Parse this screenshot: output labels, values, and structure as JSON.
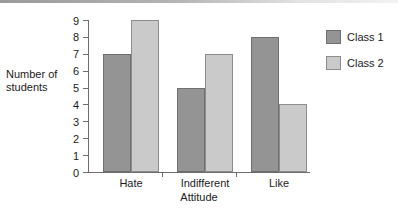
{
  "chart_data": {
    "type": "bar",
    "title": "",
    "xlabel": "Attitude",
    "ylabel": "Number of students",
    "ylabel_lines": [
      "Number of",
      "students"
    ],
    "categories": [
      "Hate",
      "Indifferent",
      "Like"
    ],
    "series": [
      {
        "name": "Class 1",
        "color": "#949494",
        "values": [
          7,
          5,
          8
        ]
      },
      {
        "name": "Class 2",
        "color": "#cacaca",
        "values": [
          9,
          7,
          4
        ]
      }
    ],
    "ylim": [
      0,
      9
    ],
    "yticks": [
      0,
      1,
      2,
      3,
      4,
      5,
      6,
      7,
      8,
      9
    ],
    "ytick_labels": [
      "0",
      "1",
      "2",
      "3",
      "4",
      "5",
      "6",
      "7",
      "8",
      "9"
    ],
    "grid": false,
    "legend_position": "right"
  }
}
